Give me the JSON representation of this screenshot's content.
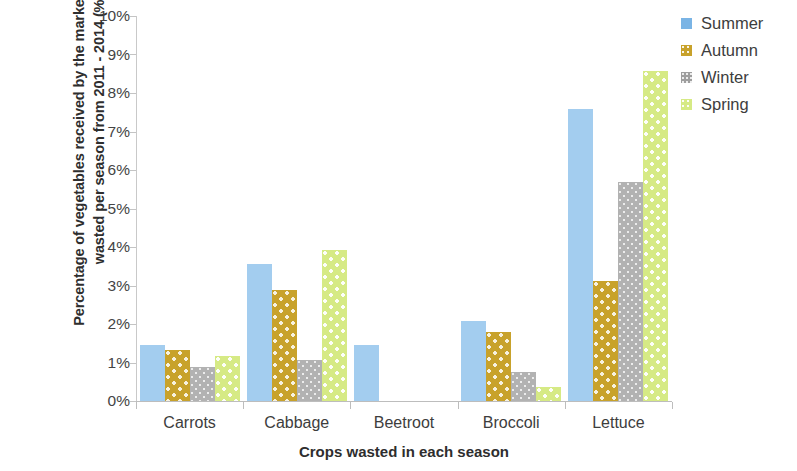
{
  "chart_data": {
    "type": "bar",
    "title": "",
    "subtitle": "",
    "xlabel": "Crops wasted in each season",
    "ylabel": "Percentage of vegetables received by the market that was wasted per season from 2011 - 2014 (%)",
    "categories": [
      "Carrots",
      "Cabbage",
      "Beetroot",
      "Broccoli",
      "Lettuce"
    ],
    "series": [
      {
        "name": "Summer",
        "color": "#a3cdef",
        "values": [
          1.45,
          3.57,
          1.45,
          2.07,
          7.58
        ]
      },
      {
        "name": "Autumn",
        "color": "#c8a22b",
        "values": [
          1.32,
          2.89,
          0,
          1.8,
          3.13
        ]
      },
      {
        "name": "Winter",
        "color": "#b2b2b2",
        "values": [
          0.88,
          1.07,
          0,
          0.75,
          5.68
        ]
      },
      {
        "name": "Spring",
        "color": "#d6ea85",
        "values": [
          1.17,
          3.93,
          0,
          0.37,
          8.57
        ]
      }
    ],
    "ylim": [
      0,
      10
    ],
    "yticks": [
      0,
      1,
      2,
      3,
      4,
      5,
      6,
      7,
      8,
      9,
      10
    ],
    "ytick_labels": [
      "0%",
      "1%",
      "2%",
      "3%",
      "4%",
      "5%",
      "6%",
      "7%",
      "8%",
      "9%",
      "10%"
    ],
    "grid": false,
    "legend_position": "right",
    "legend": [
      "Summer",
      "Autumn",
      "Winter",
      "Spring"
    ]
  }
}
